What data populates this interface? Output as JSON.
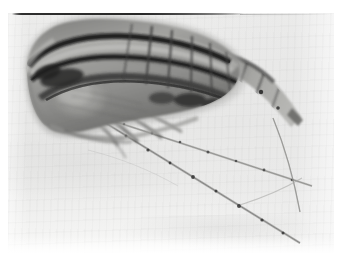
{
  "image": {
    "kind": "photomicrograph",
    "subject": "copepod",
    "tone": "grayscale",
    "width_px": 339,
    "height_px": 261,
    "alt_text": "Black and white photomicrograph of a copepod seen in lateral view, head to the left, with a teardrop-shaped cephalothorax crossed by dark longitudinal bands, a segmented urosome trailing to the right into a tapering tail, and two long jointed antennae sweeping down and to the right across a pale background.",
    "caption": "",
    "colors": {
      "paper": "#ffffff",
      "background": "#e9e9e8",
      "background_highlight": "#f6f6f5",
      "specimen_dark": "#141414",
      "specimen_mid": "#5c5c5c",
      "specimen_light": "#b9b9b7",
      "seta_line": "#8e8e8e",
      "joint_node": "#2b2b2b",
      "scan_line": "#2f2f2f"
    },
    "plate": {
      "x": 8,
      "y": 13,
      "width": 326,
      "height": 240,
      "margins": {
        "left": 8,
        "top": 13,
        "right": 5,
        "bottom": 8
      }
    },
    "artifacts": [
      {
        "name": "top-scan-line",
        "x": 12,
        "y": 13,
        "length": 232,
        "thickness": 2
      },
      {
        "name": "top-scan-line-faint",
        "x": 240,
        "y": 14,
        "length": 92,
        "thickness": 1
      },
      {
        "name": "lower-left-smudge",
        "note": "faint broad gray mottling across lower third"
      },
      {
        "name": "bottom-white-fade",
        "note": "paper highlight along bottom edge"
      }
    ],
    "anatomy": [
      {
        "name": "cephalothorax",
        "label": "Cephalothorax (prosome)",
        "position": "upper-left",
        "tone": "dark-banded"
      },
      {
        "name": "rostrum",
        "label": "Anterior / rostrum",
        "position": "left tip"
      },
      {
        "name": "dorsal-band-outer",
        "label": "Outer dorsal dark band",
        "tone": "near-black"
      },
      {
        "name": "dorsal-band-inner",
        "label": "Inner dorsal dark band",
        "tone": "near-black"
      },
      {
        "name": "gut-mass",
        "label": "Internal gut / organ mass",
        "position": "lower-left of prosome",
        "tone": "mid-gray"
      },
      {
        "name": "metasome-segments",
        "label": "Metasome segments",
        "count": 5
      },
      {
        "name": "urosome",
        "label": "Urosome",
        "position": "right",
        "count": 4
      },
      {
        "name": "caudal-ramus",
        "label": "Caudal ramus",
        "position": "far right"
      },
      {
        "name": "caudal-seta",
        "label": "Caudal seta",
        "position": "lower-right",
        "tone": "thin-gray"
      },
      {
        "name": "antenna-upper",
        "label": "First antenna (upper)",
        "joints": 7
      },
      {
        "name": "antenna-lower",
        "label": "First antenna (lower)",
        "joints": 9
      },
      {
        "name": "swimming-legs",
        "label": "Swimming legs / thoracic appendages",
        "position": "ventral, lower-middle"
      }
    ]
  }
}
